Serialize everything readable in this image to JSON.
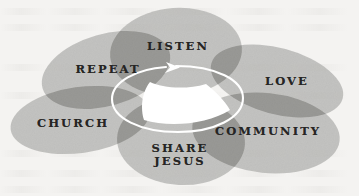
{
  "diagram": {
    "type": "overlapping-ellipse-cycle",
    "background_color": "#f4f3f1",
    "petal_fill_color": "#b7b7b4",
    "petal_overlap_color": "#a2a29e",
    "label_color": "#262524",
    "arrow_color": "#ffffff",
    "arrow_direction": "clockwise",
    "center_hub_color": "#ffffff",
    "petals": [
      {
        "id": "listen",
        "label": "LISTEN",
        "label_lines": [
          "LISTEN"
        ],
        "order": 1,
        "cx": 176,
        "cy": 52,
        "rx": 66,
        "ry": 44,
        "rotation": -4,
        "label_x": 178,
        "label_y": 46
      },
      {
        "id": "love",
        "label": "LOVE",
        "label_lines": [
          "LOVE"
        ],
        "order": 2,
        "cx": 277,
        "cy": 81,
        "rx": 68,
        "ry": 33,
        "rotation": 15,
        "label_x": 287,
        "label_y": 81
      },
      {
        "id": "community",
        "label": "COMMUNITY",
        "label_lines": [
          "COMMUNITY"
        ],
        "order": 3,
        "cx": 266,
        "cy": 133,
        "rx": 74,
        "ry": 40,
        "rotation": 6,
        "label_x": 268,
        "label_y": 131
      },
      {
        "id": "share-jesus",
        "label": "SHARE JESUS",
        "label_lines": [
          "SHARE",
          "JESUS"
        ],
        "order": 4,
        "cx": 181,
        "cy": 141,
        "rx": 64,
        "ry": 44,
        "rotation": 3,
        "label_x": 180,
        "label_y": 155
      },
      {
        "id": "church",
        "label": "CHURCH",
        "label_lines": [
          "CHURCH"
        ],
        "order": 5,
        "cx": 80,
        "cy": 120,
        "rx": 70,
        "ry": 33,
        "rotation": -8,
        "label_x": 73,
        "label_y": 123
      },
      {
        "id": "repeat",
        "label": "REPEAT",
        "label_lines": [
          "REPEAT"
        ],
        "order": 6,
        "cx": 106,
        "cy": 70,
        "rx": 66,
        "ry": 36,
        "rotation": -16,
        "label_x": 108,
        "label_y": 69
      }
    ]
  }
}
